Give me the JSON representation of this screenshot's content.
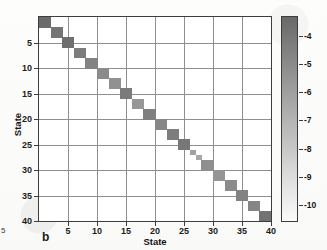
{
  "panel": {
    "letter": "b",
    "edge_fragment": "5"
  },
  "axes": {
    "xlabel": "State",
    "ylabel": "State",
    "xlim": [
      0,
      40
    ],
    "ylim": [
      0,
      40
    ],
    "xticks": [
      5,
      10,
      15,
      20,
      25,
      30,
      35,
      40
    ],
    "yticks": [
      5,
      10,
      15,
      20,
      25,
      30,
      35,
      40
    ],
    "xticklabels": [
      "5",
      "10",
      "15",
      "20",
      "25",
      "30",
      "35",
      "40"
    ],
    "yticklabels": [
      "5",
      "10",
      "15",
      "20",
      "25",
      "30",
      "35",
      "40"
    ],
    "grid": true,
    "grid_color": "#8e8e8e",
    "frame_color": "#3d3d3d",
    "background": "#ffffff"
  },
  "colorbar": {
    "title": "log covariance",
    "ticks": [
      -4,
      -5,
      -6,
      -7,
      -8,
      -9,
      -10
    ],
    "ticklabels": [
      "-4",
      "-5",
      "-6",
      "-7",
      "-8",
      "-9",
      "-10"
    ],
    "vmin": -10.6,
    "vmax": -3.3,
    "orientation": "vertical",
    "top_color": "#6d6d6d",
    "bottom_color": "#fbfbfb",
    "colormap": "grayscale-reversed"
  },
  "chart_data": {
    "type": "heatmap",
    "title": "",
    "xlabel": "State",
    "ylabel": "State",
    "xlim": [
      0,
      40
    ],
    "ylim": [
      0,
      40
    ],
    "y_axis_direction": "inverted",
    "colorbar_label": "log covariance",
    "value_range": [
      -10.6,
      -3.3
    ],
    "background_value": -10.5,
    "blocks": [
      {
        "start": 1,
        "end": 2,
        "value": -3.4
      },
      {
        "start": 3,
        "end": 4,
        "value": -3.9
      },
      {
        "start": 5,
        "end": 6,
        "value": -3.6
      },
      {
        "start": 7,
        "end": 8,
        "value": -4.3
      },
      {
        "start": 9,
        "end": 10,
        "value": -4.6
      },
      {
        "start": 11,
        "end": 12,
        "value": -5.0
      },
      {
        "start": 13,
        "end": 14,
        "value": -5.3
      },
      {
        "start": 15,
        "end": 16,
        "value": -4.2
      },
      {
        "start": 17,
        "end": 18,
        "value": -5.6
      },
      {
        "start": 19,
        "end": 20,
        "value": -4.4
      },
      {
        "start": 21,
        "end": 22,
        "value": -4.8
      },
      {
        "start": 23,
        "end": 24,
        "value": -4.3
      },
      {
        "start": 25,
        "end": 26,
        "value": -4.0
      },
      {
        "start": 27,
        "end": 27,
        "value": -6.1
      },
      {
        "start": 28,
        "end": 28,
        "value": -6.4
      },
      {
        "start": 29,
        "end": 30,
        "value": -5.2
      },
      {
        "start": 31,
        "end": 32,
        "value": -5.5
      },
      {
        "start": 33,
        "end": 34,
        "value": -5.0
      },
      {
        "start": 35,
        "end": 36,
        "value": -4.6
      },
      {
        "start": 37,
        "end": 38,
        "value": -4.7
      },
      {
        "start": 39,
        "end": 40,
        "value": -3.8
      }
    ]
  }
}
